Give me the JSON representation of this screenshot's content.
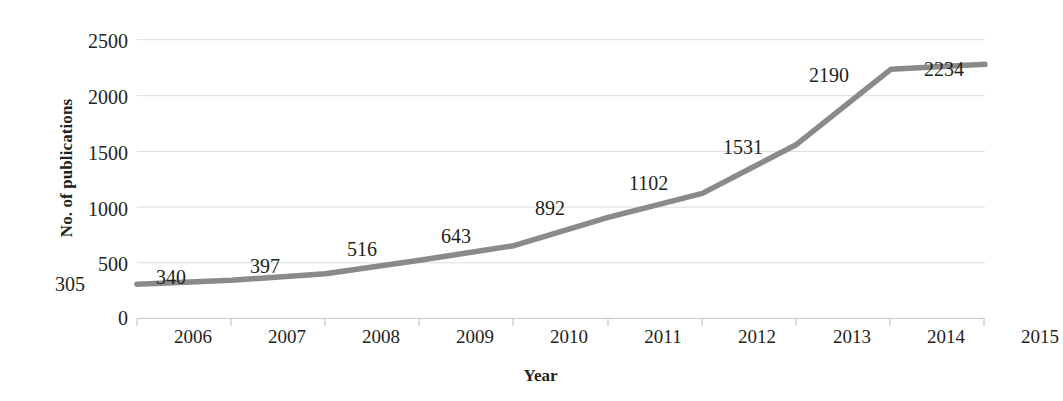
{
  "chart_data": {
    "type": "line",
    "title": "",
    "xlabel": "Year",
    "ylabel": "No. of publications",
    "categories": [
      "2006",
      "2007",
      "2008",
      "2009",
      "2010",
      "2011",
      "2012",
      "2013",
      "2014",
      "2015"
    ],
    "values": [
      305,
      340,
      397,
      516,
      643,
      892,
      1102,
      1531,
      2190,
      2234
    ],
    "data_labels": [
      "305",
      "340",
      "397",
      "516",
      "643",
      "892",
      "1102",
      "1531",
      "2190",
      "2234"
    ],
    "ylim": [
      0,
      2500
    ],
    "yticks": [
      "2500",
      "2000",
      "1500",
      "1000",
      "500",
      "0"
    ],
    "ytick_values": [
      2500,
      2000,
      1500,
      1000,
      500,
      0
    ],
    "grid": true,
    "legend": "none",
    "series_color": "#8a8a8a",
    "axis_color": "#d9d9d9",
    "text_color": "#231f20"
  }
}
